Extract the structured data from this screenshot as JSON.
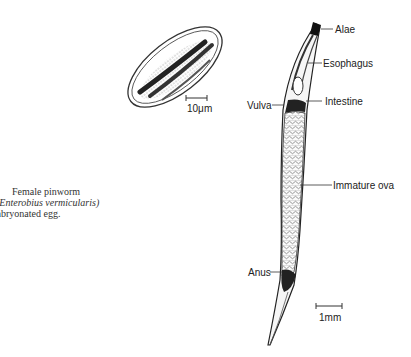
{
  "caption": {
    "line1": "Female pinworm",
    "line2": "(Enterobius vermicularis)",
    "line3": "nbryonated egg."
  },
  "egg": {
    "scale_label": "10μm"
  },
  "worm": {
    "labels": {
      "alae": "Alae",
      "esophagus": "Esophagus",
      "vulva": "Vulva",
      "intestine": "Intestine",
      "immature_ova": "Immature ova",
      "anus": "Anus"
    },
    "scale_label": "1mm"
  }
}
